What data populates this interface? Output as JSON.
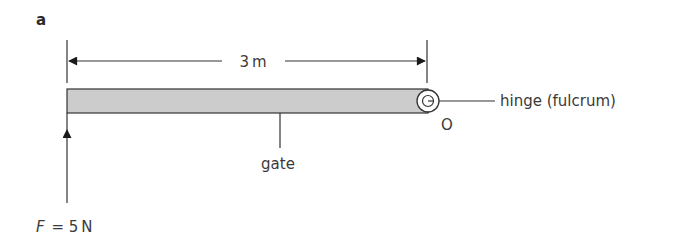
{
  "figure": {
    "panel_label": "a",
    "dimension": {
      "label": "3 m",
      "value": 3,
      "unit": "m"
    },
    "beam": {
      "label": "gate",
      "fill_color": "#cccccc",
      "stroke_color": "#333333"
    },
    "hinge": {
      "label": "hinge (fulcrum)",
      "point_label": "O"
    },
    "force": {
      "symbol": "F",
      "equals": "=",
      "value_text": "5 N",
      "value": 5,
      "unit": "N",
      "direction": "up"
    }
  }
}
